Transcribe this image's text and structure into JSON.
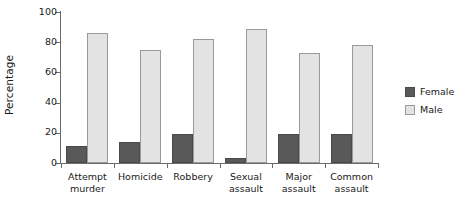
{
  "chart_data": {
    "type": "bar",
    "title": "",
    "xlabel": "",
    "ylabel": "Percentage",
    "ylim": [
      0,
      100
    ],
    "yticks": [
      0,
      20,
      40,
      60,
      80,
      100
    ],
    "ytick_labels": [
      "0",
      "20",
      "40",
      "60",
      "80",
      "100"
    ],
    "grid": false,
    "legend_position": "right",
    "categories": [
      "Attempt murder",
      "Homicide",
      "Robbery",
      "Sexual assault",
      "Major assault",
      "Common assault"
    ],
    "category_lines": [
      [
        "Attempt",
        "murder"
      ],
      [
        "Homicide",
        ""
      ],
      [
        "Robbery",
        ""
      ],
      [
        "Sexual",
        "assault"
      ],
      [
        "Major",
        "assault"
      ],
      [
        "Common",
        "assault"
      ]
    ],
    "series": [
      {
        "name": "Female",
        "color": "#595959",
        "values": [
          11,
          14,
          19,
          3,
          19,
          19
        ]
      },
      {
        "name": "Male",
        "color": "#e3e3e3",
        "values": [
          86,
          75,
          82,
          89,
          73,
          78
        ]
      }
    ]
  },
  "legend": {
    "items": [
      {
        "label": "Female"
      },
      {
        "label": "Male"
      }
    ]
  },
  "axes": {
    "y_title": "Percentage"
  },
  "colors": {
    "female_fill": "#595959",
    "female_border": "#4a4a4a",
    "male_fill": "#e3e3e3",
    "male_border": "#9a9a9a",
    "axis": "#6b6b6b",
    "text": "#1a1a1a",
    "background": "#ffffff"
  }
}
